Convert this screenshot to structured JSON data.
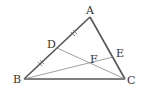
{
  "diagram": {
    "type": "geometry-triangle",
    "points": {
      "A": {
        "label": "A",
        "x": 90,
        "y": 17
      },
      "B": {
        "label": "B",
        "x": 24,
        "y": 79
      },
      "C": {
        "label": "C",
        "x": 125,
        "y": 79
      },
      "D": {
        "label": "D",
        "x": 57,
        "y": 48
      },
      "E": {
        "label": "E",
        "x": 113,
        "y": 57
      },
      "F": {
        "label": "F",
        "x": 91,
        "y": 66
      }
    },
    "segments": [
      "AB",
      "BC",
      "CA",
      "DC",
      "BE"
    ],
    "equal_marks": [
      "AD",
      "DB"
    ],
    "colors": {
      "triangle": "#555555",
      "cevian": "#888888",
      "label": "#333333"
    }
  }
}
